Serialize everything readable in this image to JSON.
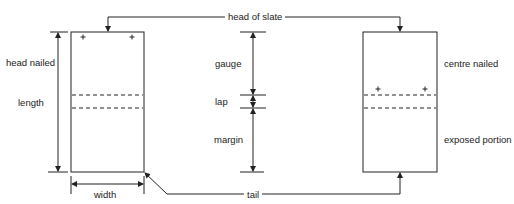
{
  "diagram": {
    "labels": {
      "head_of_slate": "head of slate",
      "head_nailed": "head nailed",
      "length": "length",
      "width": "width",
      "gauge": "gauge",
      "lap": "lap",
      "margin": "margin",
      "centre_nailed": "centre nailed",
      "exposed_portion": "exposed portion",
      "tail": "tail"
    },
    "colors": {
      "line": "#222222",
      "background": "#ffffff"
    }
  }
}
